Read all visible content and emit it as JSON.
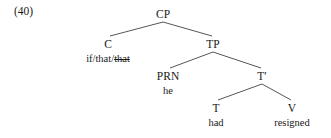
{
  "example": {
    "number": "(40)"
  },
  "tree": {
    "nodes": [
      {
        "id": "cp",
        "label": "CP",
        "x": 163,
        "y": 8,
        "terminal": null
      },
      {
        "id": "c",
        "label": "C",
        "x": 108,
        "y": 38,
        "terminal": null
      },
      {
        "id": "tp",
        "label": "TP",
        "x": 213,
        "y": 38,
        "terminal": null
      },
      {
        "id": "prn",
        "label": "PRN",
        "x": 168,
        "y": 70,
        "terminal": "he"
      },
      {
        "id": "tbar",
        "label": "T′",
        "x": 262,
        "y": 70,
        "terminal": null
      },
      {
        "id": "t",
        "label": "T",
        "x": 216,
        "y": 102,
        "terminal": "had"
      },
      {
        "id": "v",
        "label": "V",
        "x": 292,
        "y": 102,
        "terminal": "resigned"
      }
    ],
    "c_terminal": {
      "plain": "if/that/",
      "struck": "that"
    },
    "edges": [
      {
        "from": "cp",
        "to": "c",
        "x1": 163,
        "y1": 22,
        "x2": 110,
        "y2": 36
      },
      {
        "from": "cp",
        "to": "tp",
        "x1": 163,
        "y1": 22,
        "x2": 212,
        "y2": 36
      },
      {
        "from": "tp",
        "to": "prn",
        "x1": 213,
        "y1": 52,
        "x2": 170,
        "y2": 68
      },
      {
        "from": "tp",
        "to": "tbar",
        "x1": 213,
        "y1": 52,
        "x2": 261,
        "y2": 68
      },
      {
        "from": "tbar",
        "to": "t",
        "x1": 262,
        "y1": 84,
        "x2": 218,
        "y2": 100
      },
      {
        "from": "tbar",
        "to": "v",
        "x1": 262,
        "y1": 84,
        "x2": 291,
        "y2": 100
      }
    ],
    "line_color": "#2b2b2b",
    "line_width": 0.8
  }
}
